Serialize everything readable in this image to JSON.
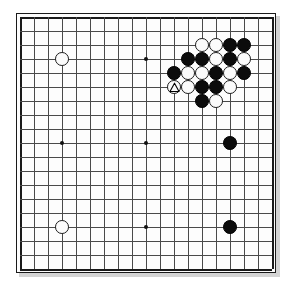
{
  "board": {
    "name": "go-board",
    "size": 19,
    "label": "Go board 19x19",
    "origin_x": 20,
    "origin_y": 17,
    "spacing": 14,
    "line_color": "#4a4a4a",
    "edge_color": "#1a1a1a",
    "background_color": "#fdfdfd",
    "black_color": "#0c0c0c",
    "white_color": "#fbfbfb",
    "hoshi_points": [
      {
        "col": 3,
        "row": 3
      },
      {
        "col": 9,
        "row": 3
      },
      {
        "col": 15,
        "row": 3
      },
      {
        "col": 3,
        "row": 9
      },
      {
        "col": 9,
        "row": 9
      },
      {
        "col": 15,
        "row": 9
      },
      {
        "col": 3,
        "row": 15
      },
      {
        "col": 9,
        "row": 15
      },
      {
        "col": 15,
        "row": 15
      }
    ],
    "stones": [
      {
        "col": 3,
        "row": 3,
        "color": "white",
        "name": "stone-white-d16"
      },
      {
        "col": 13,
        "row": 2,
        "color": "white",
        "name": "stone-white-n17"
      },
      {
        "col": 14,
        "row": 2,
        "color": "white",
        "name": "stone-white-o17"
      },
      {
        "col": 15,
        "row": 2,
        "color": "black",
        "name": "stone-black-p17"
      },
      {
        "col": 16,
        "row": 2,
        "color": "black",
        "name": "stone-black-q17"
      },
      {
        "col": 12,
        "row": 3,
        "color": "black",
        "name": "stone-black-m16"
      },
      {
        "col": 13,
        "row": 3,
        "color": "black",
        "name": "stone-black-n16"
      },
      {
        "col": 14,
        "row": 3,
        "color": "white",
        "name": "stone-white-o16"
      },
      {
        "col": 15,
        "row": 3,
        "color": "black",
        "name": "stone-black-p16"
      },
      {
        "col": 16,
        "row": 3,
        "color": "white",
        "name": "stone-white-q16"
      },
      {
        "col": 11,
        "row": 4,
        "color": "black",
        "name": "stone-black-l15"
      },
      {
        "col": 12,
        "row": 4,
        "color": "white",
        "name": "stone-white-m15"
      },
      {
        "col": 13,
        "row": 4,
        "color": "white",
        "name": "stone-white-n15"
      },
      {
        "col": 14,
        "row": 4,
        "color": "black",
        "name": "stone-black-o15"
      },
      {
        "col": 15,
        "row": 4,
        "color": "white",
        "name": "stone-white-p15"
      },
      {
        "col": 16,
        "row": 4,
        "color": "black",
        "name": "stone-black-q15"
      },
      {
        "col": 11,
        "row": 5,
        "color": "white",
        "name": "stone-white-l14-marked"
      },
      {
        "col": 12,
        "row": 5,
        "color": "white",
        "name": "stone-white-m14"
      },
      {
        "col": 13,
        "row": 5,
        "color": "black",
        "name": "stone-black-n14"
      },
      {
        "col": 14,
        "row": 5,
        "color": "black",
        "name": "stone-black-o14"
      },
      {
        "col": 15,
        "row": 5,
        "color": "white",
        "name": "stone-white-p14"
      },
      {
        "col": 13,
        "row": 6,
        "color": "black",
        "name": "stone-black-n13"
      },
      {
        "col": 14,
        "row": 6,
        "color": "white",
        "name": "stone-white-o13"
      },
      {
        "col": 15,
        "row": 9,
        "color": "black",
        "name": "stone-black-p10"
      },
      {
        "col": 3,
        "row": 15,
        "color": "white",
        "name": "stone-white-d4"
      },
      {
        "col": 15,
        "row": 15,
        "color": "black",
        "name": "stone-black-p4"
      }
    ],
    "markers": [
      {
        "col": 11,
        "row": 5,
        "shape": "triangle",
        "on": "white",
        "name": "triangle-marker"
      }
    ]
  }
}
